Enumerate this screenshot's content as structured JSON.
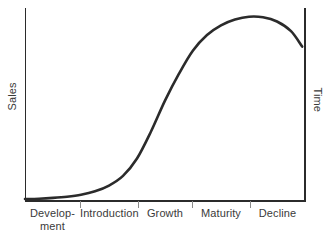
{
  "chart_data": {
    "type": "line",
    "title": "",
    "subtitle": "",
    "xlabel": "Time",
    "ylabel": "Sales",
    "grid": false,
    "legend": "none",
    "axis_labels": {
      "y_left": "Sales",
      "y_right": "Time"
    },
    "categories": [
      "Develop-\nment",
      "Introduction",
      "Growth",
      "Maturity",
      "Decline"
    ],
    "category_labels_flat": [
      "Development",
      "Introduction",
      "Growth",
      "Maturity",
      "Decline"
    ],
    "stage_boundaries_x": [
      0,
      20,
      40,
      60,
      80,
      100
    ],
    "xlim": [
      0,
      100
    ],
    "ylim": [
      0,
      100
    ],
    "x_tick_values": [
      20,
      40,
      60,
      80
    ],
    "x_tick_labels": [
      "",
      "",
      "",
      ""
    ],
    "y_tick_values": [],
    "y_tick_labels": [],
    "series": [
      {
        "name": "Sales",
        "color": "#2b2b2b",
        "x": [
          0,
          5,
          10,
          15,
          20,
          25,
          30,
          35,
          40,
          45,
          50,
          55,
          60,
          65,
          70,
          75,
          80,
          85,
          90,
          95,
          99
        ],
        "values": [
          1,
          1.2,
          1.6,
          2.2,
          3.2,
          5,
          8,
          13,
          22,
          36,
          52,
          66,
          78,
          86,
          91,
          94,
          95.5,
          95.2,
          93,
          88,
          80
        ]
      }
    ],
    "curve_description": "Classic S-shaped product life cycle curve: flat through Development, slow rise in Introduction, steep rise through Growth, plateau peak in Maturity, then falling in Decline",
    "annotations": []
  },
  "axes": {
    "left_axis_color": "#2b2b2b",
    "right_axis_color": "#2b2b2b",
    "baseline_color": "#2b2b2b",
    "tick_color": "#7a7a7a"
  },
  "colors": {
    "background": "#ffffff",
    "curve": "#2b2b2b",
    "text": "#3a3a3a"
  },
  "stages": [
    {
      "id": "development",
      "label": "Develop-\nment",
      "left": 25,
      "width": 55
    },
    {
      "id": "introduction",
      "label": "Introduction",
      "left": 80,
      "width": 58
    },
    {
      "id": "growth",
      "label": "Growth",
      "left": 138,
      "width": 54
    },
    {
      "id": "maturity",
      "label": "Maturity",
      "left": 192,
      "width": 58
    },
    {
      "id": "decline",
      "label": "Decline",
      "left": 250,
      "width": 55
    }
  ]
}
